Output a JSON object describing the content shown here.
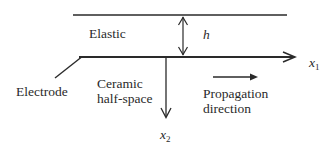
{
  "diagram": {
    "title": "",
    "colors": {
      "line": "#2a2a2a",
      "text": "#2a2a2a",
      "background": "#ffffff"
    },
    "labels": {
      "elastic": "Elastic",
      "thickness": "h",
      "x1_axis": "x",
      "x1_axis_sub": "1",
      "x2_axis": "x",
      "x2_axis_sub": "2",
      "electrode": "Electrode",
      "ceramic_line1": "Ceramic",
      "ceramic_line2": "half-space",
      "propagation_line1": "Propagation",
      "propagation_line2": "direction"
    },
    "elements": [
      {
        "id": "elastic-layer-top-boundary",
        "type": "line"
      },
      {
        "id": "interface-x1-axis",
        "type": "arrow",
        "direction": "right"
      },
      {
        "id": "thickness-h-arrow",
        "type": "double-arrow",
        "direction": "vertical"
      },
      {
        "id": "x2-axis",
        "type": "arrow",
        "direction": "down"
      },
      {
        "id": "electrode-leader",
        "type": "line"
      },
      {
        "id": "propagation-arrow",
        "type": "arrow",
        "direction": "right"
      }
    ]
  }
}
